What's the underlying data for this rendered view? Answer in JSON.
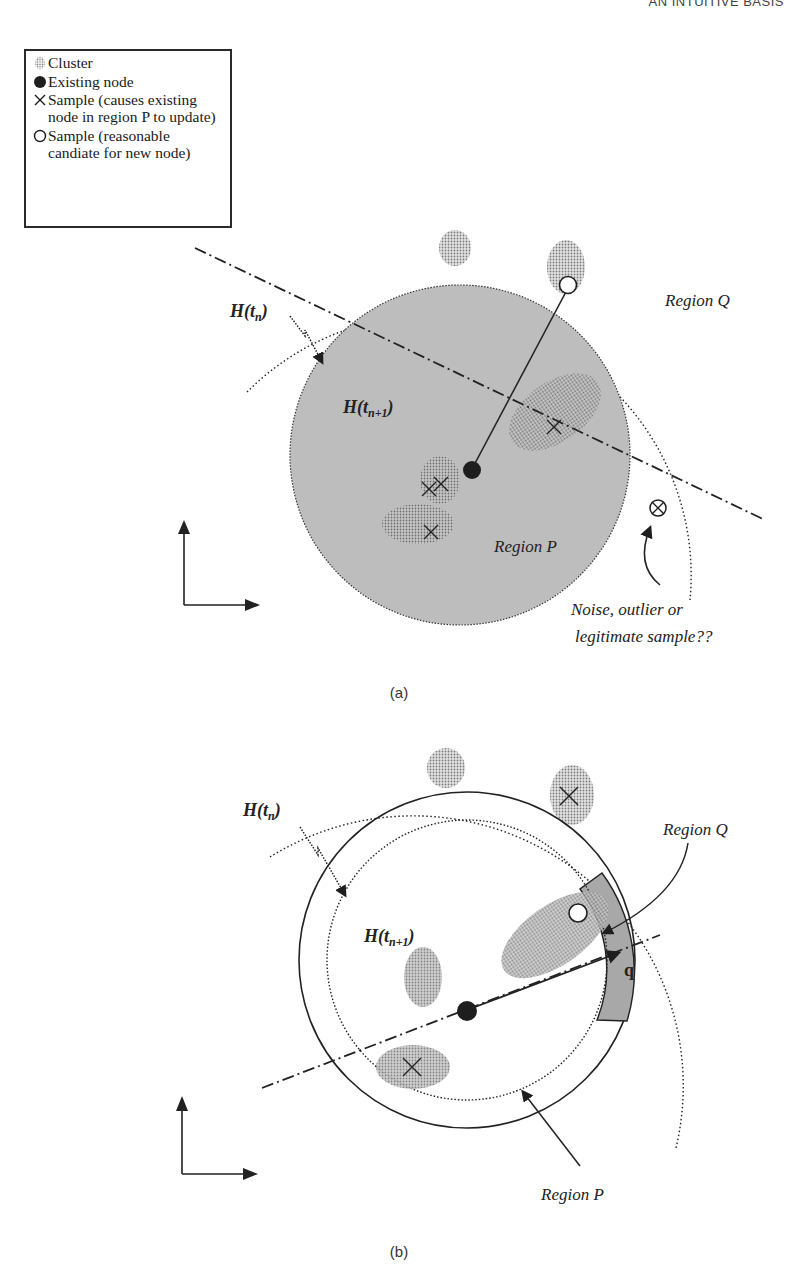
{
  "header": {
    "running_title": "AN INTUITIVE BASIS"
  },
  "legend": {
    "items": [
      {
        "symbol": "cluster",
        "label": "Cluster"
      },
      {
        "symbol": "filled-circle",
        "label": "Existing node"
      },
      {
        "symbol": "cross",
        "label": "Sample (causes existing\nnode in region P to update)"
      },
      {
        "symbol": "open-circle",
        "label": "Sample (reasonable\ncandiate for new node)"
      }
    ]
  },
  "diagram_a": {
    "caption": "(a)",
    "labels": {
      "h_tn": "H(t",
      "h_tn_sub": "n",
      "h_tn1": "H(t",
      "h_tn1_sub": "n+1",
      "close_paren": ")",
      "region_q": "Region Q",
      "region_p": "Region P",
      "annotation_line1": "Noise, outlier or",
      "annotation_line2": "legitimate sample??"
    }
  },
  "diagram_b": {
    "caption": "(b)",
    "labels": {
      "h_tn": "H(t",
      "h_tn_sub": "n",
      "h_tn1": "H(t",
      "h_tn1_sub": "n+1",
      "close_paren": ")",
      "region_q": "Region Q",
      "region_p": "Region P",
      "vector_q": "q"
    }
  },
  "colors": {
    "region_fill": "#b9b9b9",
    "cluster_dot": "#8a8a8a",
    "segment_fill": "#a8a8a8",
    "ink": "#1e1e1e"
  }
}
